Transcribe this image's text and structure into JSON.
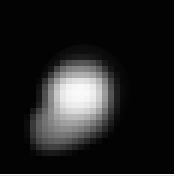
{
  "image": {
    "kind": "astronomical-grayscale-plate",
    "subject": "pixelated irregular solar-system body",
    "colors": {
      "background": "#ffffff",
      "sky": "#030303",
      "peak_highlight": "#f2f2f2",
      "mid_tone": "#9a9a9a",
      "faint_tone": "#3a3a3a"
    },
    "frame": {
      "x": 0,
      "y": 0,
      "width": 174,
      "height": 174
    },
    "mosaic": {
      "cell_size": 6,
      "cols": 29,
      "rows": 29,
      "origin_x": 0,
      "origin_y": 0,
      "note": "grid of 6px square samples; values are 0-255 gray levels"
    }
  },
  "chart_data": {
    "type": "heatmap",
    "title": "",
    "xlabel": "",
    "ylabel": "",
    "colormap": "grayscale",
    "vmin": 0,
    "vmax": 255,
    "cell_size": 6,
    "cols": 29,
    "rows": 29,
    "values": [
      [
        0,
        0,
        0,
        0,
        0,
        0,
        0,
        0,
        0,
        0,
        0,
        0,
        0,
        0,
        0,
        0,
        0,
        0,
        0,
        0,
        0,
        0,
        0,
        0,
        0,
        0,
        0,
        0,
        0
      ],
      [
        0,
        0,
        0,
        0,
        0,
        0,
        0,
        0,
        0,
        0,
        0,
        0,
        0,
        0,
        0,
        0,
        0,
        0,
        0,
        0,
        0,
        0,
        0,
        0,
        0,
        0,
        0,
        0,
        0
      ],
      [
        0,
        0,
        0,
        0,
        0,
        0,
        0,
        0,
        0,
        0,
        0,
        0,
        0,
        0,
        0,
        0,
        0,
        0,
        0,
        0,
        0,
        0,
        0,
        0,
        0,
        0,
        0,
        0,
        0
      ],
      [
        0,
        0,
        0,
        0,
        0,
        0,
        0,
        0,
        0,
        0,
        0,
        0,
        0,
        0,
        0,
        0,
        0,
        0,
        0,
        0,
        0,
        0,
        0,
        0,
        0,
        0,
        0,
        0,
        0
      ],
      [
        0,
        0,
        0,
        0,
        0,
        0,
        0,
        0,
        0,
        0,
        0,
        0,
        0,
        0,
        0,
        0,
        0,
        0,
        0,
        0,
        0,
        0,
        0,
        0,
        0,
        0,
        0,
        0,
        0
      ],
      [
        0,
        0,
        0,
        0,
        0,
        0,
        0,
        0,
        0,
        0,
        0,
        0,
        0,
        0,
        0,
        0,
        0,
        0,
        0,
        0,
        0,
        0,
        0,
        0,
        0,
        0,
        0,
        0,
        0
      ],
      [
        0,
        0,
        0,
        0,
        0,
        0,
        0,
        0,
        0,
        0,
        0,
        0,
        0,
        0,
        0,
        0,
        0,
        0,
        0,
        0,
        0,
        0,
        0,
        0,
        0,
        0,
        0,
        0,
        0
      ],
      [
        0,
        0,
        0,
        0,
        0,
        0,
        0,
        0,
        0,
        0,
        0,
        0,
        0,
        0,
        0,
        0,
        0,
        0,
        0,
        0,
        0,
        0,
        0,
        0,
        0,
        0,
        0,
        0,
        0
      ],
      [
        0,
        0,
        0,
        0,
        0,
        0,
        0,
        0,
        0,
        0,
        0,
        0,
        0,
        0,
        0,
        0,
        0,
        0,
        0,
        0,
        0,
        0,
        0,
        0,
        0,
        0,
        0,
        0,
        0
      ],
      [
        0,
        0,
        0,
        0,
        0,
        0,
        0,
        0,
        0,
        0,
        6,
        10,
        14,
        16,
        14,
        10,
        6,
        2,
        0,
        0,
        0,
        0,
        0,
        0,
        0,
        0,
        0,
        0,
        0
      ],
      [
        0,
        0,
        0,
        0,
        0,
        0,
        0,
        0,
        0,
        10,
        42,
        62,
        70,
        74,
        72,
        62,
        40,
        14,
        4,
        0,
        0,
        0,
        0,
        0,
        0,
        0,
        0,
        0,
        0
      ],
      [
        0,
        0,
        0,
        0,
        0,
        0,
        0,
        0,
        14,
        60,
        96,
        116,
        124,
        126,
        122,
        110,
        84,
        44,
        12,
        2,
        0,
        0,
        0,
        0,
        0,
        0,
        0,
        0,
        0
      ],
      [
        0,
        0,
        0,
        0,
        0,
        0,
        0,
        10,
        52,
        104,
        140,
        158,
        166,
        168,
        164,
        152,
        126,
        84,
        34,
        8,
        0,
        0,
        0,
        0,
        0,
        0,
        0,
        0,
        0
      ],
      [
        0,
        0,
        0,
        0,
        0,
        0,
        6,
        40,
        96,
        150,
        192,
        214,
        222,
        224,
        220,
        206,
        176,
        122,
        56,
        14,
        2,
        0,
        0,
        0,
        0,
        0,
        0,
        0,
        0
      ],
      [
        0,
        0,
        0,
        0,
        0,
        0,
        14,
        64,
        126,
        186,
        226,
        242,
        246,
        248,
        244,
        232,
        198,
        142,
        70,
        20,
        4,
        0,
        0,
        0,
        0,
        0,
        0,
        0,
        0
      ],
      [
        0,
        0,
        0,
        0,
        0,
        0,
        18,
        74,
        136,
        198,
        234,
        246,
        250,
        250,
        248,
        238,
        206,
        150,
        76,
        22,
        4,
        0,
        0,
        0,
        0,
        0,
        0,
        0,
        0
      ],
      [
        0,
        0,
        0,
        0,
        0,
        0,
        20,
        76,
        136,
        196,
        232,
        244,
        248,
        248,
        244,
        234,
        202,
        146,
        74,
        22,
        4,
        0,
        0,
        0,
        0,
        0,
        0,
        0,
        0
      ],
      [
        0,
        0,
        0,
        0,
        0,
        6,
        30,
        82,
        132,
        186,
        220,
        234,
        238,
        238,
        232,
        220,
        188,
        134,
        66,
        18,
        2,
        0,
        0,
        0,
        0,
        0,
        0,
        0,
        0
      ],
      [
        0,
        0,
        0,
        0,
        2,
        24,
        62,
        100,
        138,
        176,
        202,
        214,
        218,
        216,
        208,
        192,
        160,
        110,
        52,
        14,
        2,
        0,
        0,
        0,
        0,
        0,
        0,
        0,
        0
      ],
      [
        0,
        0,
        0,
        0,
        8,
        46,
        86,
        112,
        136,
        160,
        176,
        184,
        186,
        182,
        172,
        154,
        124,
        82,
        36,
        8,
        0,
        0,
        0,
        0,
        0,
        0,
        0,
        0,
        0
      ],
      [
        0,
        0,
        0,
        0,
        12,
        58,
        94,
        114,
        130,
        146,
        156,
        160,
        158,
        150,
        138,
        118,
        92,
        56,
        22,
        4,
        0,
        0,
        0,
        0,
        0,
        0,
        0,
        0,
        0
      ],
      [
        0,
        0,
        0,
        0,
        12,
        58,
        92,
        110,
        122,
        132,
        138,
        138,
        132,
        122,
        108,
        88,
        64,
        36,
        12,
        2,
        0,
        0,
        0,
        0,
        0,
        0,
        0,
        0,
        0
      ],
      [
        0,
        0,
        0,
        0,
        10,
        52,
        84,
        100,
        110,
        116,
        118,
        114,
        104,
        90,
        74,
        54,
        34,
        16,
        4,
        0,
        0,
        0,
        0,
        0,
        0,
        0,
        0,
        0,
        0
      ],
      [
        0,
        0,
        0,
        0,
        6,
        40,
        70,
        84,
        92,
        96,
        94,
        86,
        72,
        56,
        38,
        22,
        10,
        2,
        0,
        0,
        0,
        0,
        0,
        0,
        0,
        0,
        0,
        0,
        0
      ],
      [
        0,
        0,
        0,
        0,
        2,
        20,
        44,
        58,
        64,
        64,
        58,
        48,
        34,
        20,
        10,
        4,
        0,
        0,
        0,
        0,
        0,
        0,
        0,
        0,
        0,
        0,
        0,
        0,
        0
      ],
      [
        0,
        0,
        0,
        0,
        0,
        6,
        16,
        24,
        26,
        24,
        18,
        12,
        6,
        2,
        0,
        0,
        0,
        0,
        0,
        0,
        0,
        0,
        0,
        0,
        0,
        0,
        0,
        0,
        0
      ],
      [
        0,
        0,
        0,
        0,
        0,
        0,
        2,
        4,
        4,
        4,
        2,
        0,
        0,
        0,
        0,
        0,
        0,
        0,
        0,
        0,
        0,
        0,
        0,
        0,
        0,
        0,
        0,
        0,
        0
      ],
      [
        0,
        0,
        0,
        0,
        0,
        0,
        0,
        0,
        0,
        0,
        0,
        0,
        0,
        0,
        0,
        0,
        0,
        0,
        0,
        0,
        0,
        0,
        0,
        0,
        0,
        0,
        0,
        0,
        0
      ],
      [
        0,
        0,
        0,
        0,
        0,
        0,
        0,
        0,
        0,
        0,
        0,
        0,
        0,
        0,
        0,
        0,
        0,
        0,
        0,
        0,
        0,
        0,
        0,
        0,
        0,
        0,
        0,
        0,
        0
      ]
    ]
  }
}
